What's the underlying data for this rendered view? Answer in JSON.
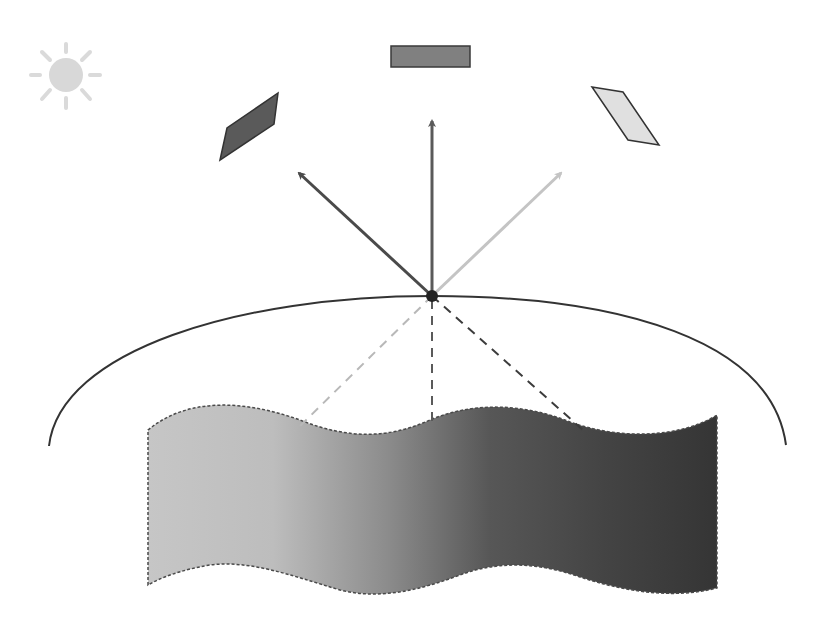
{
  "diagram": {
    "colors": {
      "background": "#ffffff",
      "sun": "#d8d8d8",
      "top_bar_fill": "#808080",
      "left_patch_fill": "#5a5a5a",
      "right_patch_fill": "#e0e0e0",
      "arrow_left": "#4a4a4a",
      "arrow_center": "#5a5a5a",
      "arrow_right": "#c4c4c4",
      "dashed_left": "#b8b8b8",
      "dashed_center": "#5a5a5a",
      "dashed_right": "#3c3c3c",
      "arc": "#333333",
      "surface_gradient": [
        "#c4c4c4",
        "#8a8a8a",
        "#4a4a4a",
        "#333333"
      ]
    },
    "elements": {
      "sun": {
        "cx": 66,
        "cy": 75,
        "r": 16,
        "rays": 8
      },
      "top_bar": {
        "x": 391,
        "y": 46,
        "w": 79,
        "h": 21
      },
      "left_patch": {
        "points": "223,160 229,128 278,93 274,124"
      },
      "right_patch": {
        "points": "592,87 622,92 659,145 628,140"
      },
      "center_point": {
        "cx": 432,
        "cy": 296,
        "r": 6
      },
      "arrows": [
        {
          "name": "left",
          "from": [
            432,
            296
          ],
          "to": [
            297,
            171
          ]
        },
        {
          "name": "center",
          "from": [
            432,
            296
          ],
          "to": [
            432,
            119
          ]
        },
        {
          "name": "right",
          "from": [
            432,
            296
          ],
          "to": [
            563,
            171
          ]
        }
      ],
      "dashed_lines": [
        {
          "name": "left",
          "from": [
            432,
            296
          ],
          "to": [
            295,
            431
          ]
        },
        {
          "name": "center",
          "from": [
            432,
            296
          ],
          "to": [
            432,
            427
          ]
        },
        {
          "name": "right",
          "from": [
            432,
            296
          ],
          "to": [
            583,
            430
          ]
        }
      ],
      "arc": {
        "start": [
          49,
          446
        ],
        "top": [
          432,
          296
        ],
        "end": [
          786,
          445
        ]
      },
      "surface_strip": {
        "x_left": 148,
        "x_right": 717,
        "top_y_range": [
          400,
          432
        ],
        "bottom_y_range": [
          566,
          597
        ]
      }
    }
  }
}
